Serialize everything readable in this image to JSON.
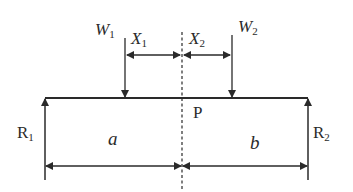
{
  "diagram": {
    "type": "simply-supported-beam",
    "labels": {
      "w1": {
        "main": "W",
        "sub": "1"
      },
      "w2": {
        "main": "W",
        "sub": "2"
      },
      "x1": {
        "main": "X",
        "sub": "1"
      },
      "x2": {
        "main": "X",
        "sub": "2"
      },
      "r1": {
        "main": "R",
        "sub": "1"
      },
      "r2": {
        "main": "R",
        "sub": "2"
      },
      "p": "P",
      "a": "a",
      "b": "b"
    },
    "colors": {
      "line": "#2a2a2a",
      "background": "#ffffff"
    }
  }
}
